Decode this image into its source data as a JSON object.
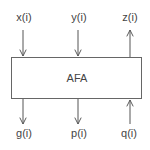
{
  "block": {
    "label": "AFA"
  },
  "inputs_top": [
    {
      "label": "x(i)",
      "direction": "in"
    },
    {
      "label": "y(i)",
      "direction": "in"
    },
    {
      "label": "z(i)",
      "direction": "out"
    }
  ],
  "outputs_bottom": [
    {
      "label": "g(i)",
      "direction": "out"
    },
    {
      "label": "p(i)",
      "direction": "out"
    },
    {
      "label": "q(i)",
      "direction": "in"
    }
  ],
  "colors": {
    "stroke": "#555555",
    "text": "#444444"
  }
}
